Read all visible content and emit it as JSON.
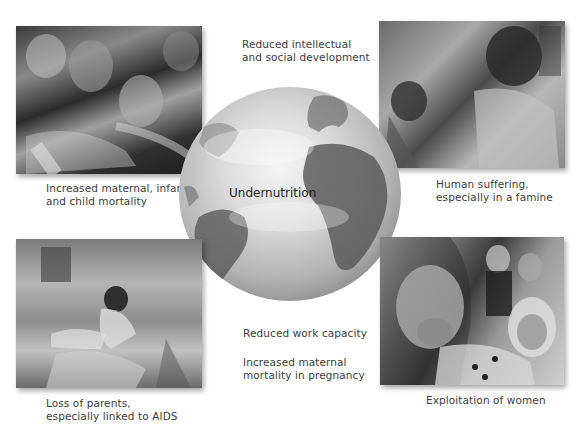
{
  "center": {
    "label": "Undernutrition",
    "icon": "globe-icon"
  },
  "effects": {
    "top_center": [
      "Reduced intellectual",
      "and social development"
    ],
    "top_left": [
      "Increased maternal, infant,",
      "and child mortality"
    ],
    "top_right": [
      "Human suffering,",
      "especially in a famine"
    ],
    "bottom_left": [
      "Loss of parents,",
      "especially linked to AIDS"
    ],
    "bottom_center_1": [
      "Reduced work capacity"
    ],
    "bottom_center_2": [
      "Increased maternal",
      "mortality in pregnancy"
    ],
    "bottom_right": [
      "Exploitation of women"
    ]
  },
  "photos": [
    {
      "id": "top_left",
      "subject": "crowd reaching for food"
    },
    {
      "id": "top_right",
      "subject": "children in famine"
    },
    {
      "id": "bottom_left",
      "subject": "child in rubble"
    },
    {
      "id": "bottom_right",
      "subject": "crying woman"
    }
  ],
  "colors": {
    "text": "#3c3c3c",
    "background": "#ffffff"
  }
}
